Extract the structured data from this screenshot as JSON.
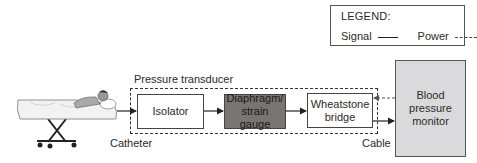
{
  "legend": {
    "title": "LEGEND:",
    "signal_label": "Signal",
    "power_label": "Power",
    "signal_line_style": "solid",
    "power_line_style": "dashed"
  },
  "patient": {
    "icon": "patient-on-stretcher-icon"
  },
  "labels": {
    "catheter": "Catheter",
    "cable": "Cable"
  },
  "transducer": {
    "label": "Pressure transducer",
    "blocks": [
      {
        "id": "isolator",
        "label": "Isolator"
      },
      {
        "id": "diaphragm",
        "label_line1": "Diaphragm/",
        "label_line2": "strain gauge"
      },
      {
        "id": "wheatstone",
        "label_line1": "Wheatstone",
        "label_line2": "bridge"
      }
    ]
  },
  "monitor": {
    "label_line1": "Blood",
    "label_line2": "pressure",
    "label_line3": "monitor"
  },
  "colors": {
    "diaphragm_fill": "#7a7472",
    "monitor_fill": "#dadadd",
    "line": "#222222"
  }
}
